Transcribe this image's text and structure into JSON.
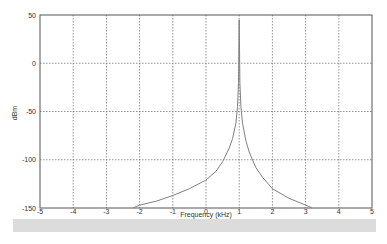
{
  "chart_data": {
    "type": "line",
    "title": "",
    "xlabel": "Frequency (kHz)",
    "ylabel": "dBm",
    "xlim": [
      -5,
      5
    ],
    "ylim": [
      -150,
      50
    ],
    "xticks": [
      -5,
      -4,
      -3,
      -2,
      -1,
      0,
      1,
      2,
      3,
      4,
      5
    ],
    "yticks": [
      -150,
      -100,
      -50,
      0,
      50
    ],
    "grid": true,
    "legend": null,
    "series": [
      {
        "name": "spectrum",
        "color": "#808080",
        "x": [
          -2.2,
          -2.0,
          -1.5,
          -1.0,
          -0.5,
          0.0,
          0.3,
          0.5,
          0.7,
          0.8,
          0.9,
          0.95,
          0.98,
          1.0,
          1.02,
          1.05,
          1.1,
          1.2,
          1.3,
          1.5,
          1.7,
          2.0,
          2.5,
          3.0,
          3.2
        ],
        "y": [
          -150,
          -147,
          -143,
          -137,
          -130,
          -121,
          -112,
          -102,
          -88,
          -78,
          -62,
          -45,
          -20,
          45,
          -20,
          -45,
          -62,
          -80,
          -92,
          -108,
          -118,
          -130,
          -140,
          -147,
          -150
        ]
      }
    ]
  },
  "labels": {
    "xlabel": "Frequency (kHz)",
    "ylabel": "dBm",
    "xticks": [
      "-5",
      "-4",
      "-3",
      "-2",
      "-1",
      "0",
      "1",
      "2",
      "3",
      "4",
      "5"
    ],
    "yticks": [
      "50",
      "0",
      "-50",
      "-100",
      "-150"
    ]
  }
}
